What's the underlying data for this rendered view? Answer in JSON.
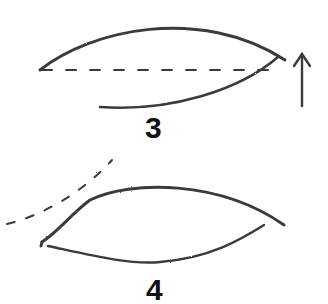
{
  "figure": {
    "ink_color": "#333333",
    "steps": [
      {
        "label": "3"
      },
      {
        "label": "4"
      }
    ]
  }
}
